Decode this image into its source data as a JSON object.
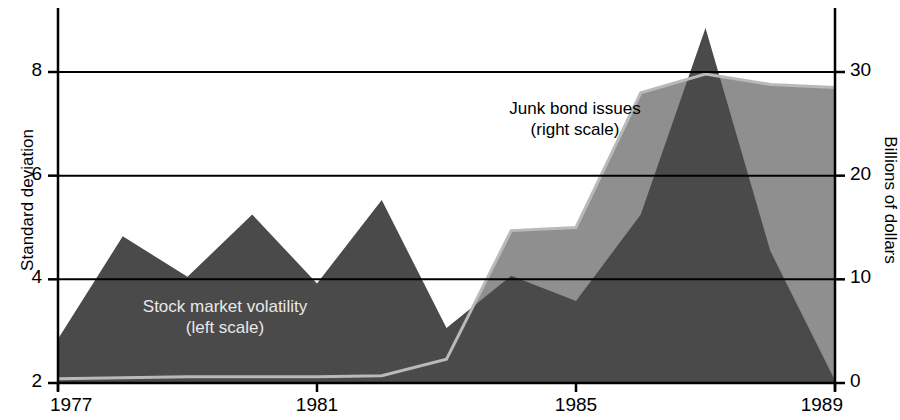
{
  "axes": {
    "left_title": "Standard deviation",
    "right_title": "Billions of dollars",
    "left_ticks": [
      "8",
      "6",
      "4",
      "2"
    ],
    "right_ticks": [
      "30",
      "20",
      "10",
      "0"
    ],
    "x_ticks": [
      "1977",
      "1981",
      "1985",
      "1989"
    ]
  },
  "annotations": {
    "junk_line1": "Junk bond issues",
    "junk_line2": "(right scale)",
    "stock_line1": "Stock market volatility",
    "stock_line2": "(left scale)"
  },
  "colors": {
    "stock_fill": "#4a4a4a",
    "junk_fill": "#8f8f8f",
    "axis": "#000000",
    "background": "#ffffff",
    "stock_label": "#e8e8e8",
    "junk_label": "#000000"
  },
  "chart_data": {
    "type": "area",
    "title": "",
    "xlabel": "",
    "grid": true,
    "legend": "inline-annotations",
    "x": [
      1977,
      1978,
      1979,
      1980,
      1981,
      1982,
      1983,
      1984,
      1985,
      1986,
      1987,
      1988,
      1989
    ],
    "series": [
      {
        "name": "Stock market volatility (left scale)",
        "axis": "left",
        "unit": "Standard deviation",
        "ylabel": "Standard deviation",
        "ylim": [
          2,
          8.8
        ],
        "yticks": [
          2,
          4,
          6,
          8
        ],
        "color": "#4a4a4a",
        "values": [
          2.85,
          4.83,
          4.05,
          5.25,
          3.92,
          5.53,
          3.06,
          4.07,
          3.58,
          5.25,
          8.85,
          4.55,
          2.05
        ]
      },
      {
        "name": "Junk bond issues (right scale)",
        "axis": "right",
        "unit": "Billions of dollars",
        "ylabel": "Billions of dollars",
        "ylim": [
          0,
          33
        ],
        "yticks": [
          0,
          10,
          20,
          30
        ],
        "color": "#8f8f8f",
        "values": [
          0.4,
          0.5,
          0.6,
          0.6,
          0.6,
          0.7,
          2.3,
          14.7,
          15.0,
          28.0,
          29.8,
          28.8,
          28.5
        ]
      }
    ]
  }
}
